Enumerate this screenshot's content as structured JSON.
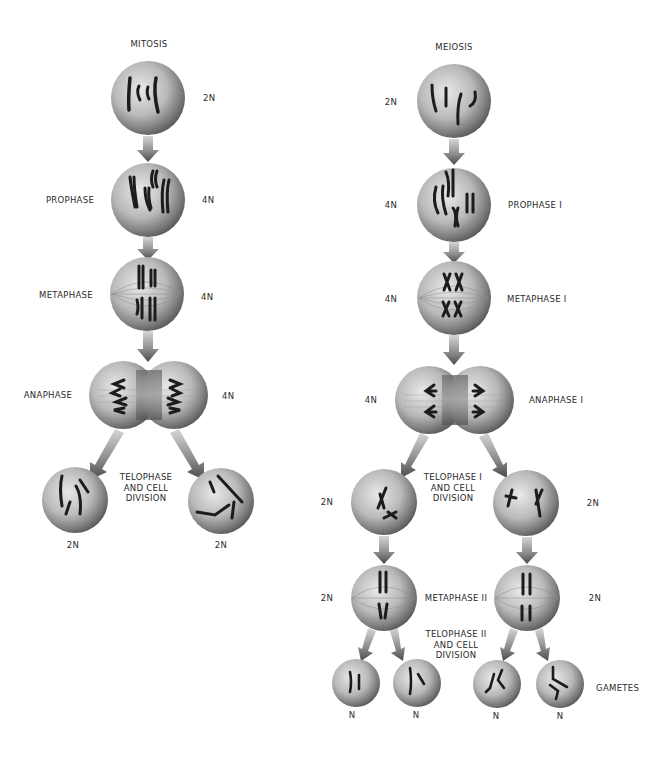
{
  "diagram": {
    "mitosis": {
      "title": "MITOSIS",
      "stages": [
        {
          "id": "interphase",
          "ploidy": "2N",
          "label": ""
        },
        {
          "id": "prophase",
          "ploidy": "4N",
          "label": "PROPHASE"
        },
        {
          "id": "metaphase",
          "ploidy": "4N",
          "label": "METAPHASE"
        },
        {
          "id": "anaphase",
          "ploidy": "4N",
          "label": "ANAPHASE"
        }
      ],
      "telophase_label": "TELOPHASE\nAND CELL\nDIVISION",
      "daughter_ploidy": [
        "2N",
        "2N"
      ]
    },
    "meiosis": {
      "title": "MEIOSIS",
      "stages": [
        {
          "id": "interphase",
          "ploidy": "2N",
          "label": ""
        },
        {
          "id": "prophase-i",
          "ploidy": "4N",
          "label": "PROPHASE I"
        },
        {
          "id": "metaphase-i",
          "ploidy": "4N",
          "label": "METAPHASE I"
        },
        {
          "id": "anaphase-i",
          "ploidy": "4N",
          "label": "ANAPHASE I"
        }
      ],
      "telophase_i_label": "TELOPHASE I\nAND CELL\nDIVISION",
      "telophase_i_ploidy": [
        "2N",
        "2N"
      ],
      "metaphase_ii_label": "METAPHASE II",
      "metaphase_ii_ploidy": [
        "2N",
        "2N"
      ],
      "telophase_ii_label": "TELOPHASE II\nAND CELL\nDIVISION",
      "gametes_label": "GAMETES",
      "gamete_ploidy": [
        "N",
        "N",
        "N",
        "N"
      ]
    }
  }
}
